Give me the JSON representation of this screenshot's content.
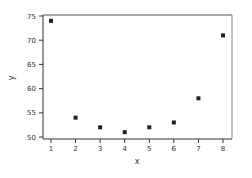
{
  "chart_data": {
    "type": "scatter",
    "title": "",
    "xlabel": "x",
    "ylabel": "y",
    "x": [
      1,
      2,
      3,
      4,
      5,
      6,
      7,
      8
    ],
    "y": [
      74,
      54,
      52,
      51,
      52,
      53,
      58,
      71
    ],
    "xticks": [
      1,
      2,
      3,
      4,
      5,
      6,
      7,
      8
    ],
    "yticks": [
      50,
      55,
      60,
      65,
      70,
      75
    ],
    "xlim": [
      0.65,
      8.35
    ],
    "ylim": [
      49.8,
      75.5
    ],
    "grid": false,
    "legend": null,
    "marker": "square",
    "marker_color": "#222222"
  }
}
